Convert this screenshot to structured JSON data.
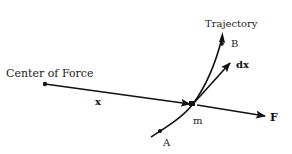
{
  "diagram": {
    "labels": {
      "center_of_force": "Center of Force",
      "trajectory": "Trajectory",
      "point_b": "B",
      "point_a": "A",
      "displacement": "dx",
      "position_vector": "x",
      "mass": "m",
      "force": "F"
    },
    "colors": {
      "ink": "#111111",
      "background": "#ffffff"
    }
  }
}
